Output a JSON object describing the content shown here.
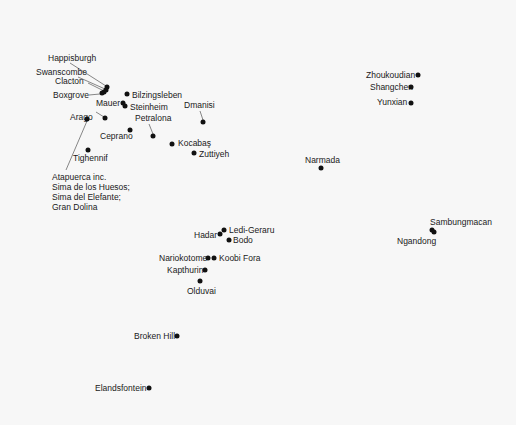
{
  "map": {
    "title": "",
    "dot_color": "#111111",
    "leader_color": "#555555",
    "sites": [
      {
        "name": "Happisburgh",
        "x": 107,
        "y": 87,
        "lx": 48,
        "ly": 53
      },
      {
        "name": "Swanscombe",
        "x": 106,
        "y": 90,
        "lx": 36,
        "ly": 67
      },
      {
        "name": "Clacton",
        "x": 104,
        "y": 92,
        "lx": 55,
        "ly": 76
      },
      {
        "name": "Boxgrove",
        "x": 102,
        "y": 93,
        "lx": 53,
        "ly": 90
      },
      {
        "name": "Bilzingsleben",
        "x": 127,
        "y": 94,
        "lx": 132,
        "ly": 90
      },
      {
        "name": "Mauer",
        "x": 123,
        "y": 103,
        "lx": 96,
        "ly": 98
      },
      {
        "name": "Steinheim",
        "x": 125,
        "y": 106,
        "lx": 130,
        "ly": 102
      },
      {
        "name": "Arago",
        "x": 105,
        "y": 118,
        "lx": 70,
        "ly": 112
      },
      {
        "name": "Petralona",
        "x": 153,
        "y": 136,
        "lx": 135,
        "ly": 113
      },
      {
        "name": "Ceprano",
        "x": 130,
        "y": 130,
        "lx": 100,
        "ly": 131
      },
      {
        "name": "Dmanisi",
        "x": 203,
        "y": 122,
        "lx": 184,
        "ly": 100
      },
      {
        "name": "Kocabaş",
        "x": 172,
        "y": 144,
        "lx": 178,
        "ly": 138
      },
      {
        "name": "Zuttiyeh",
        "x": 194,
        "y": 153,
        "lx": 199,
        "ly": 149
      },
      {
        "name": "Tighennif",
        "x": 88,
        "y": 150,
        "lx": 73,
        "ly": 153
      },
      {
        "name": "Atapuerca inc.\nSima de los Huesos;\nSima del Elefante;\nGran Dolina",
        "x": 87,
        "y": 119,
        "lx": 52,
        "ly": 172,
        "multi": true
      },
      {
        "name": "Zhoukoudian",
        "x": 418,
        "y": 75,
        "lx": 366,
        "ly": 70
      },
      {
        "name": "Shangchen",
        "x": 411,
        "y": 87,
        "lx": 370,
        "ly": 82
      },
      {
        "name": "Yunxian",
        "x": 411,
        "y": 103,
        "lx": 377,
        "ly": 97
      },
      {
        "name": "Narmada",
        "x": 321,
        "y": 168,
        "lx": 305,
        "ly": 155
      },
      {
        "name": "Sambungmacan",
        "x": 432,
        "y": 230,
        "lx": 430,
        "ly": 217
      },
      {
        "name": "Ngandong",
        "x": 434,
        "y": 232,
        "lx": 397,
        "ly": 236
      },
      {
        "name": "Hadar",
        "x": 220,
        "y": 234,
        "lx": 194,
        "ly": 230
      },
      {
        "name": "Ledi-Geraru",
        "x": 224,
        "y": 230,
        "lx": 229,
        "ly": 225
      },
      {
        "name": "Bodo",
        "x": 229,
        "y": 240,
        "lx": 233,
        "ly": 235
      },
      {
        "name": "Nariokotome",
        "x": 208,
        "y": 258,
        "lx": 159,
        "ly": 253
      },
      {
        "name": "Koobi Fora",
        "x": 214,
        "y": 258,
        "lx": 219,
        "ly": 253
      },
      {
        "name": "Kapthurin",
        "x": 205,
        "y": 270,
        "lx": 167,
        "ly": 265
      },
      {
        "name": "Olduvai",
        "x": 200,
        "y": 281,
        "lx": 187,
        "ly": 286
      },
      {
        "name": "Broken Hill",
        "x": 177,
        "y": 336,
        "lx": 134,
        "ly": 331
      },
      {
        "name": "Elandsfontein",
        "x": 149,
        "y": 388,
        "lx": 95,
        "ly": 383
      }
    ],
    "leaders": [
      {
        "from": "Happisburgh",
        "x1": 70,
        "y1": 63,
        "x2": 106,
        "y2": 86
      },
      {
        "from": "Swanscombe",
        "x1": 78,
        "y1": 77,
        "x2": 105,
        "y2": 89
      },
      {
        "from": "Clacton",
        "x1": 88,
        "y1": 83,
        "x2": 104,
        "y2": 91
      },
      {
        "from": "Boxgrove",
        "x1": 89,
        "y1": 95,
        "x2": 100,
        "y2": 94
      },
      {
        "from": "Arago",
        "x1": 96,
        "y1": 112,
        "x2": 104,
        "y2": 117
      },
      {
        "from": "Petralona",
        "x1": 149,
        "y1": 124,
        "x2": 153,
        "y2": 134
      },
      {
        "from": "Dmanisi",
        "x1": 200,
        "y1": 111,
        "x2": 203,
        "y2": 120
      },
      {
        "from": "Atapuerca",
        "x1": 87,
        "y1": 121,
        "x2": 66,
        "y2": 170
      }
    ]
  }
}
